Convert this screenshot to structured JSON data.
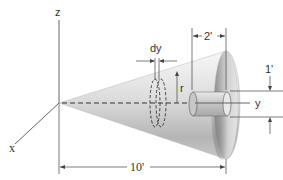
{
  "figure": {
    "axes": {
      "x_label": "x",
      "y_label": "y",
      "z_label": "z"
    },
    "dimensions": {
      "length_label": "10'",
      "hole_depth_label": "2'",
      "hole_radius_label": "1'",
      "element_thickness_label": "dy",
      "element_radius_label": "r"
    },
    "colors": {
      "cone_light": "#f4f4f4",
      "cone_dark": "#9a9a9a",
      "line": "#444444",
      "background": "#ffffff"
    }
  }
}
